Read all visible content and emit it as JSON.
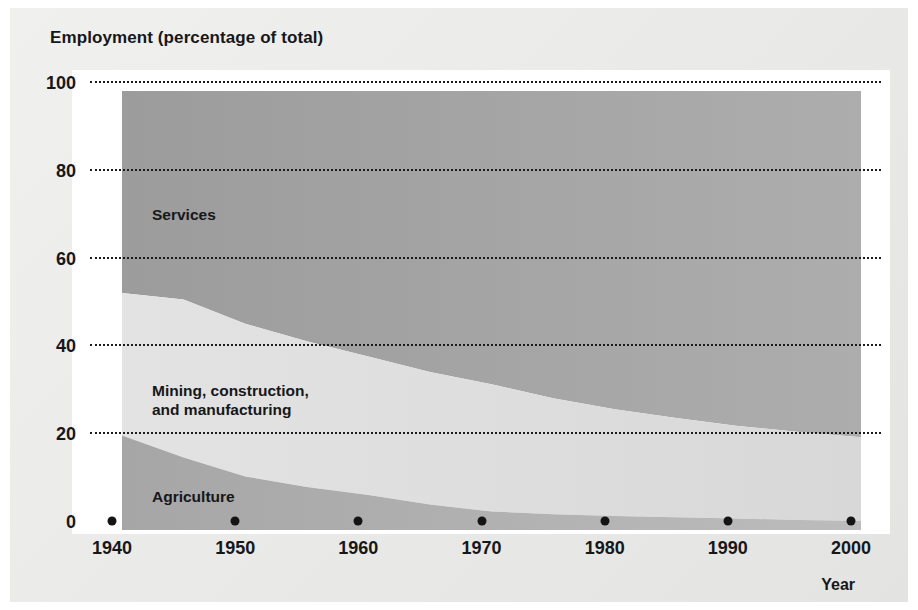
{
  "figure": {
    "title": "Employment (percentage of total)",
    "x_axis_title": "Year"
  },
  "axes": {
    "y_ticks": [
      "100",
      "80",
      "60",
      "40",
      "20",
      "0"
    ],
    "x_ticks": [
      "1940",
      "1950",
      "1960",
      "1970",
      "1980",
      "1990",
      "2000"
    ]
  },
  "labels": {
    "services": "Services",
    "mining": "Mining, construction,\nand manufacturing",
    "agriculture": "Agriculture"
  },
  "colors": {
    "background": "#e8e8e6",
    "plot_background": "#ffffff",
    "services": "#a5a5a5",
    "mining": "#dedede",
    "agriculture": "#b4b4b4",
    "gridline": "#1b1b1b",
    "text": "#17171a"
  },
  "chart_data": {
    "type": "area",
    "title": "Employment (percentage of total)",
    "xlabel": "Year",
    "ylabel": "Employment (percentage of total)",
    "xlim": [
      1940,
      2000
    ],
    "ylim": [
      0,
      100
    ],
    "grid": true,
    "legend": "inline band labels",
    "stacked": true,
    "x": [
      1940,
      1945,
      1950,
      1955,
      1960,
      1965,
      1970,
      1975,
      1980,
      1985,
      1990,
      1995,
      2000
    ],
    "series": [
      {
        "name": "Agriculture",
        "values": [
          21.5,
          16.5,
          12.2,
          9.8,
          8.0,
          5.8,
          4.2,
          3.6,
          3.2,
          2.9,
          2.6,
          2.3,
          2.1
        ]
      },
      {
        "name": "Mining, construction, and manufacturing",
        "values": [
          32.5,
          36.0,
          34.8,
          33.2,
          31.5,
          30.2,
          29.0,
          26.4,
          24.3,
          22.6,
          21.1,
          20.0,
          19.0
        ]
      },
      {
        "name": "Services",
        "values": [
          46.0,
          47.5,
          53.0,
          57.0,
          60.5,
          64.0,
          66.8,
          70.0,
          72.5,
          74.5,
          76.3,
          77.7,
          78.9
        ]
      }
    ],
    "cumulative_boundaries": {
      "agriculture_top": [
        21.5,
        16.5,
        12.2,
        9.8,
        8.0,
        5.8,
        4.2,
        3.6,
        3.2,
        2.9,
        2.6,
        2.3,
        2.1
      ],
      "mining_top": [
        54.0,
        52.5,
        47.0,
        43.0,
        39.5,
        36.0,
        33.2,
        30.0,
        27.5,
        25.5,
        23.7,
        22.3,
        21.1
      ]
    },
    "ytick_values": [
      0,
      20,
      40,
      60,
      80,
      100
    ],
    "xtick_values": [
      1940,
      1950,
      1960,
      1970,
      1980,
      1990,
      2000
    ]
  }
}
